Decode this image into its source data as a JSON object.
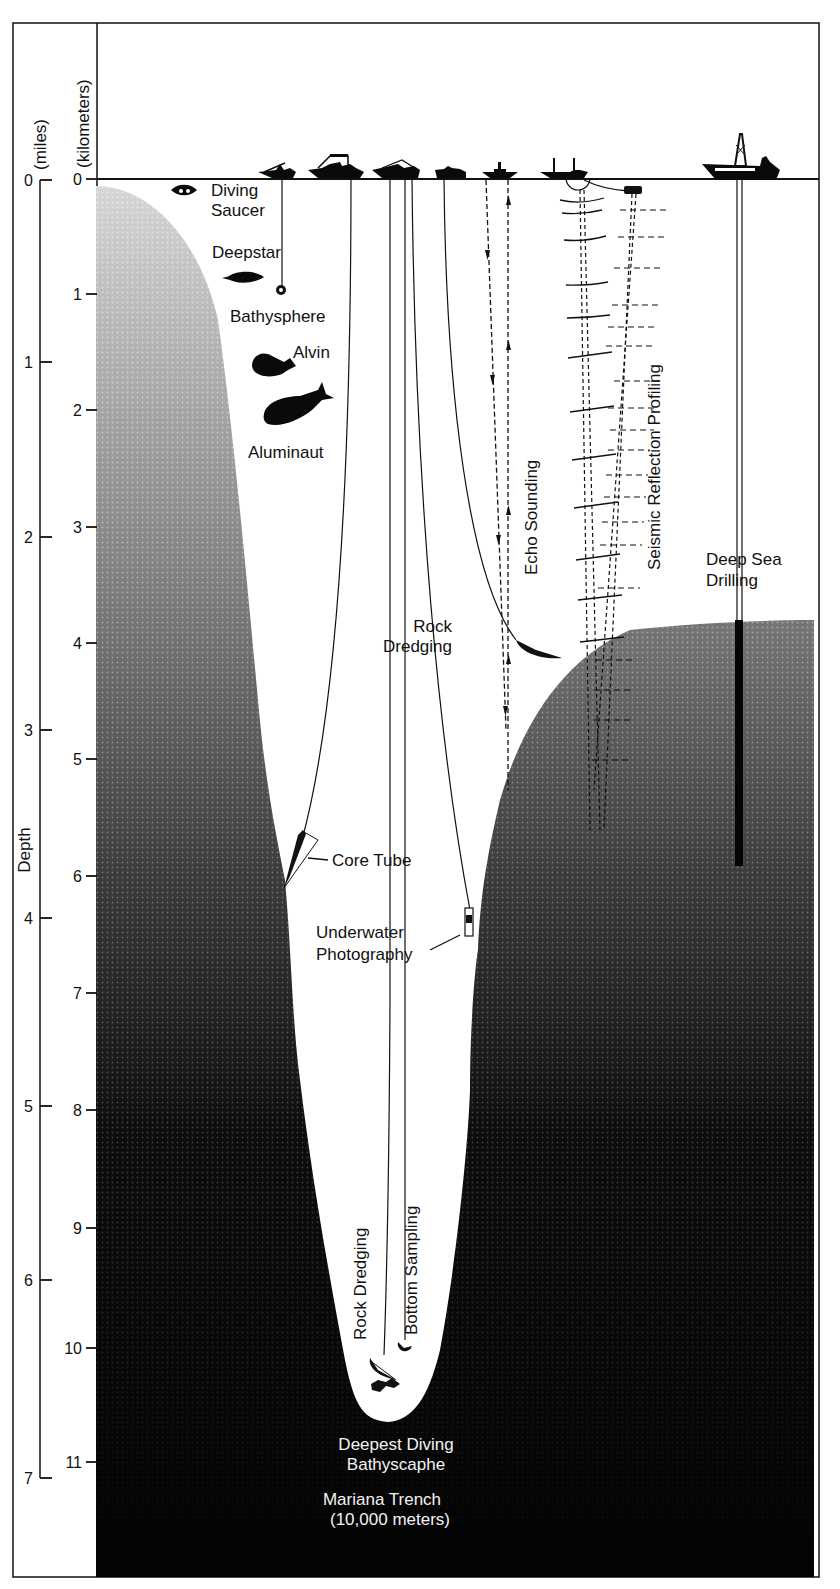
{
  "figure": {
    "colors": {
      "ink": "#111111",
      "paper": "#ffffff",
      "seafloor_light": "#bdbdbd",
      "seafloor_dark": "#050505"
    }
  },
  "axes": {
    "miles": {
      "title": "(miles)",
      "ticks": [
        "0",
        "1",
        "2",
        "3",
        "4",
        "5",
        "6",
        "7"
      ]
    },
    "kilometers": {
      "title": "(kilometers)",
      "ticks": [
        "0",
        "1",
        "2",
        "3",
        "4",
        "5",
        "6",
        "7",
        "8",
        "9",
        "10",
        "11"
      ]
    },
    "depth_label": "Depth"
  },
  "labels": {
    "diving_saucer": [
      "Diving",
      "Saucer"
    ],
    "deepstar": "Deepstar",
    "bathysphere": "Bathysphere",
    "alvin": "Alvin",
    "aluminaut": "Aluminaut",
    "echo_sounding": "Echo Sounding",
    "seismic": "Seismic Reflection Profiling",
    "deep_sea_drilling": [
      "Deep Sea",
      "Drilling"
    ],
    "rock_dredging_upper": [
      "Rock",
      "Dredging"
    ],
    "core_tube": "Core Tube",
    "underwater_photography": [
      "Underwater",
      "Photography"
    ],
    "rock_dredging_lower": "Rock Dredging",
    "bottom_sampling": "Bottom Sampling",
    "bathyscaphe": [
      "Deepest Diving",
      "Bathyscaphe"
    ],
    "trench": [
      "Mariana Trench",
      "(10,000 meters)"
    ]
  }
}
